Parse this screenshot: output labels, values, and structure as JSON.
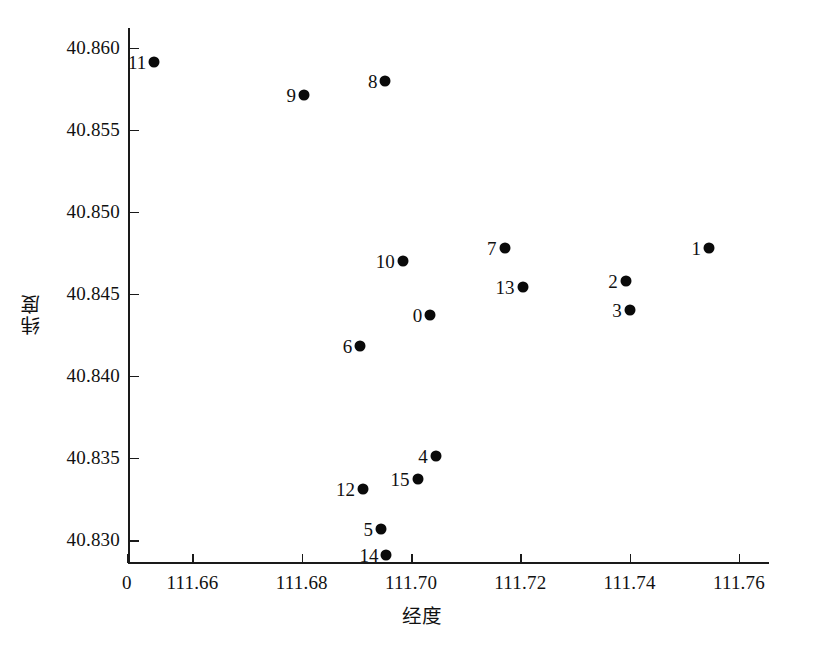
{
  "chart_data": {
    "type": "scatter",
    "title": "",
    "xlabel": "经度",
    "ylabel": "纬度",
    "xlim": [
      111.6482,
      111.7655
    ],
    "ylim": [
      40.8286,
      40.8612
    ],
    "grid": false,
    "legend": "none",
    "xticks": [
      {
        "label": "0",
        "value": 111.648
      },
      {
        "label": "111.66",
        "value": 111.66
      },
      {
        "label": "111.68",
        "value": 111.68
      },
      {
        "label": "111.70",
        "value": 111.7
      },
      {
        "label": "111.72",
        "value": 111.72
      },
      {
        "label": "111.74",
        "value": 111.74
      },
      {
        "label": "111.76",
        "value": 111.76
      }
    ],
    "yticks": [
      {
        "label": "40.860",
        "value": 40.86
      },
      {
        "label": "40.855",
        "value": 40.855
      },
      {
        "label": "40.850",
        "value": 40.85
      },
      {
        "label": "40.845",
        "value": 40.845
      },
      {
        "label": "40.840",
        "value": 40.84
      },
      {
        "label": "40.835",
        "value": 40.835
      },
      {
        "label": "40.830",
        "value": 40.83
      }
    ],
    "marker_color": "#0a0a0a",
    "marker_size": 11,
    "points": [
      {
        "label": "0",
        "x": 111.7035,
        "y": 40.8437
      },
      {
        "label": "1",
        "x": 111.7545,
        "y": 40.8478
      },
      {
        "label": "2",
        "x": 111.7393,
        "y": 40.8458
      },
      {
        "label": "3",
        "x": 111.74,
        "y": 40.844
      },
      {
        "label": "4",
        "x": 111.7045,
        "y": 40.8351
      },
      {
        "label": "5",
        "x": 111.6945,
        "y": 40.8307
      },
      {
        "label": "6",
        "x": 111.6907,
        "y": 40.8418
      },
      {
        "label": "7",
        "x": 111.7171,
        "y": 40.8478
      },
      {
        "label": "8",
        "x": 111.6953,
        "y": 40.858
      },
      {
        "label": "9",
        "x": 111.6804,
        "y": 40.8571
      },
      {
        "label": "10",
        "x": 111.6985,
        "y": 40.847
      },
      {
        "label": "11",
        "x": 111.653,
        "y": 40.8591
      },
      {
        "label": "12",
        "x": 111.6912,
        "y": 40.8331
      },
      {
        "label": "13",
        "x": 111.7204,
        "y": 40.8454
      },
      {
        "label": "14",
        "x": 111.6955,
        "y": 40.8291
      },
      {
        "label": "15",
        "x": 111.7012,
        "y": 40.8337
      }
    ]
  }
}
